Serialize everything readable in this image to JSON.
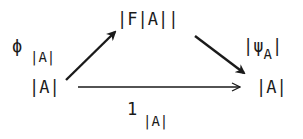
{
  "diagram": {
    "type": "commutative-triangle",
    "nodes": {
      "top": {
        "label": "|F|A||"
      },
      "left": {
        "label": "|A|"
      },
      "right": {
        "label": "|A|"
      }
    },
    "edges": {
      "left_to_top": {
        "symbol": "ϕ",
        "subscript": "|A|"
      },
      "top_to_right": {
        "prefix": "|",
        "symbol": "ψ",
        "subscript": "A",
        "suffix": "|"
      },
      "left_to_right": {
        "symbol": "1",
        "subscript": "|A|"
      }
    },
    "colors": {
      "ink": "#1a1a1a",
      "background": "#ffffff"
    }
  }
}
